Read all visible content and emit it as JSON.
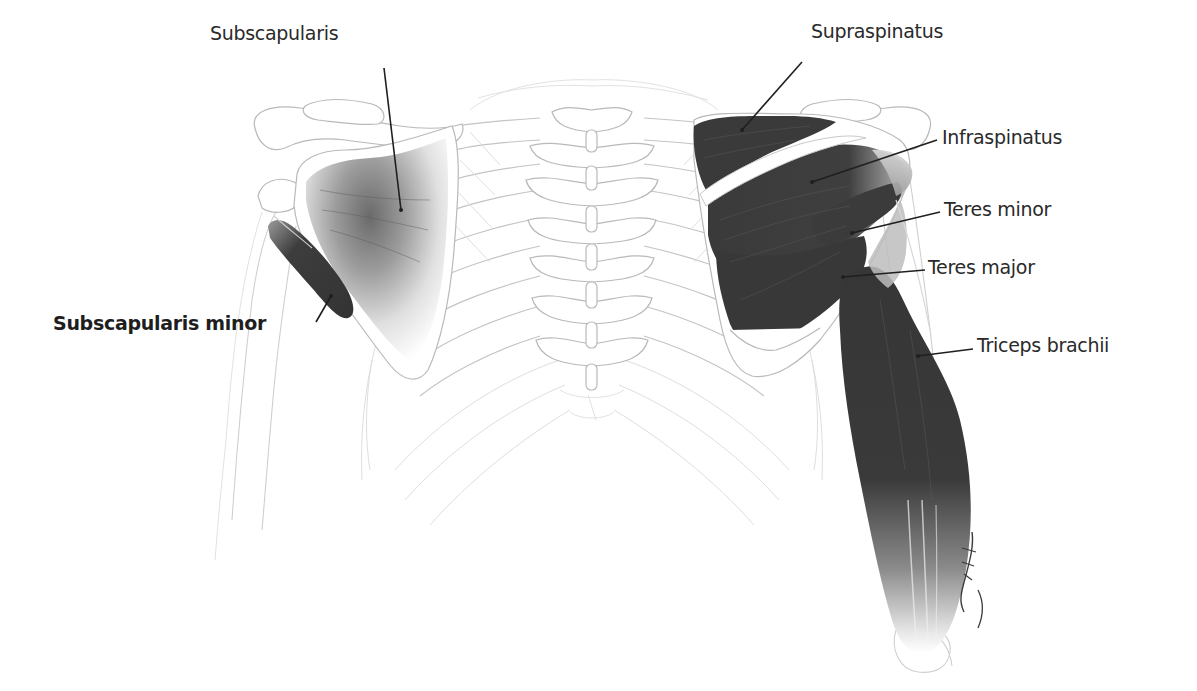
{
  "diagram": {
    "colors": {
      "muscle": "#3d3d3d",
      "muscle_dark": "#2f2f2f",
      "bone_outline": "#b9b9b9",
      "label_text": "#2a2a2a",
      "leader_line": "#1f1f1f",
      "background": "#ffffff"
    },
    "labels": [
      {
        "id": "subscapularis",
        "text": "Subscapularis",
        "bold": false,
        "x": 210,
        "y": 24,
        "pointer": {
          "x1": 384,
          "y1": 68,
          "x2": 401,
          "y2": 210
        }
      },
      {
        "id": "subscapularis-minor",
        "text": "Subscapularis minor",
        "bold": true,
        "x": 53,
        "y": 314,
        "pointer": {
          "x1": 316,
          "y1": 322,
          "x2": 331,
          "y2": 296
        }
      },
      {
        "id": "supraspinatus",
        "text": "Supraspinatus",
        "bold": false,
        "x": 811,
        "y": 22,
        "pointer": {
          "x1": 802,
          "y1": 62,
          "x2": 742,
          "y2": 130
        }
      },
      {
        "id": "infraspinatus",
        "text": "Infraspinatus",
        "bold": false,
        "x": 942,
        "y": 128,
        "pointer": {
          "x1": 937,
          "y1": 140,
          "x2": 812,
          "y2": 182
        }
      },
      {
        "id": "teres-minor",
        "text": "Teres minor",
        "bold": false,
        "x": 944,
        "y": 200,
        "pointer": {
          "x1": 940,
          "y1": 212,
          "x2": 852,
          "y2": 233
        }
      },
      {
        "id": "teres-major",
        "text": "Teres major",
        "bold": false,
        "x": 928,
        "y": 258,
        "pointer": {
          "x1": 925,
          "y1": 270,
          "x2": 843,
          "y2": 277
        }
      },
      {
        "id": "triceps-brachii",
        "text": "Triceps brachii",
        "bold": false,
        "x": 977,
        "y": 336,
        "pointer": {
          "x1": 973,
          "y1": 349,
          "x2": 918,
          "y2": 356
        }
      }
    ],
    "structures": [
      "left-scapula",
      "left-humerus",
      "left-clavicle",
      "spine",
      "ribcage",
      "right-scapula",
      "right-humerus",
      "right-clavicle",
      "supraspinatus-muscle",
      "infraspinatus-muscle",
      "teres-minor-muscle",
      "teres-major-muscle",
      "triceps-brachii-muscle",
      "subscapularis-muscle",
      "subscapularis-minor-muscle"
    ],
    "artist_signature": "signature"
  }
}
